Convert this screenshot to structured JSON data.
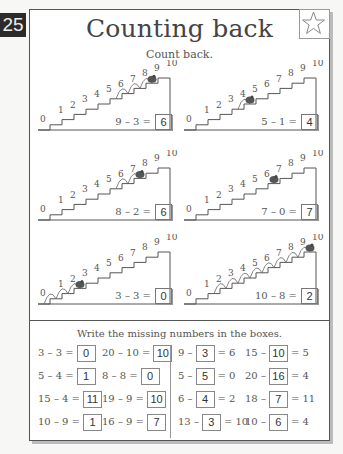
{
  "page_number": "25",
  "title": "Counting back",
  "subtitle": "Count back.",
  "star_icon": "star-outline",
  "staircases": [
    {
      "labels": [
        "0",
        "1",
        "2",
        "3",
        "4",
        "5",
        "6",
        "7",
        "8",
        "9",
        "10"
      ],
      "start": 9,
      "hops": 3,
      "equation": "9 – 3 =",
      "answer": "6"
    },
    {
      "labels": [
        "0",
        "1",
        "2",
        "3",
        "4",
        "5",
        "6",
        "7",
        "8",
        "9",
        "10"
      ],
      "start": 5,
      "hops": 1,
      "equation": "5 – 1 =",
      "answer": "4"
    },
    {
      "labels": [
        "0",
        "1",
        "2",
        "3",
        "4",
        "5",
        "6",
        "7",
        "8",
        "9",
        "10"
      ],
      "start": 8,
      "hops": 2,
      "equation": "8 – 2 =",
      "answer": "6"
    },
    {
      "labels": [
        "0",
        "1",
        "2",
        "3",
        "4",
        "5",
        "6",
        "7",
        "8",
        "9",
        "10"
      ],
      "start": 7,
      "hops": 0,
      "equation": "7 – 0 =",
      "answer": "7"
    },
    {
      "labels": [
        "0",
        "1",
        "2",
        "3",
        "4",
        "5",
        "6",
        "7",
        "8",
        "9",
        "10"
      ],
      "start": 3,
      "hops": 3,
      "equation": "3 – 3 =",
      "answer": "0"
    },
    {
      "labels": [
        "0",
        "1",
        "2",
        "3",
        "4",
        "5",
        "6",
        "7",
        "8",
        "9",
        "10"
      ],
      "start": 10,
      "hops": 8,
      "equation": "10 – 8 =",
      "answer": "2"
    }
  ],
  "instruction": "Write the missing numbers in the boxes.",
  "exercises": [
    [
      {
        "pre": "3 – 3 =",
        "box": "0",
        "post": ""
      },
      {
        "pre": "20 – 10 =",
        "box": "10",
        "post": ""
      },
      {
        "pre": "9 –",
        "box": "3",
        "post": "= 6"
      },
      {
        "pre": "15 –",
        "box": "10",
        "post": "= 5"
      }
    ],
    [
      {
        "pre": "5 – 4 =",
        "box": "1",
        "post": ""
      },
      {
        "pre": "8 – 8 =",
        "box": "0",
        "post": ""
      },
      {
        "pre": "5 –",
        "box": "5",
        "post": "= 0"
      },
      {
        "pre": "20 –",
        "box": "16",
        "post": "= 4"
      }
    ],
    [
      {
        "pre": "15 – 4 =",
        "box": "11",
        "post": ""
      },
      {
        "pre": "19 – 9 =",
        "box": "10",
        "post": ""
      },
      {
        "pre": "6 –",
        "box": "4",
        "post": "= 2"
      },
      {
        "pre": "18 –",
        "box": "7",
        "post": "= 11"
      }
    ],
    [
      {
        "pre": "10 – 9 =",
        "box": "1",
        "post": ""
      },
      {
        "pre": "16 – 9 =",
        "box": "7",
        "post": ""
      },
      {
        "pre": "13 –",
        "box": "3",
        "post": "= 10"
      },
      {
        "pre": "10 –",
        "box": "6",
        "post": "= 4"
      }
    ]
  ]
}
